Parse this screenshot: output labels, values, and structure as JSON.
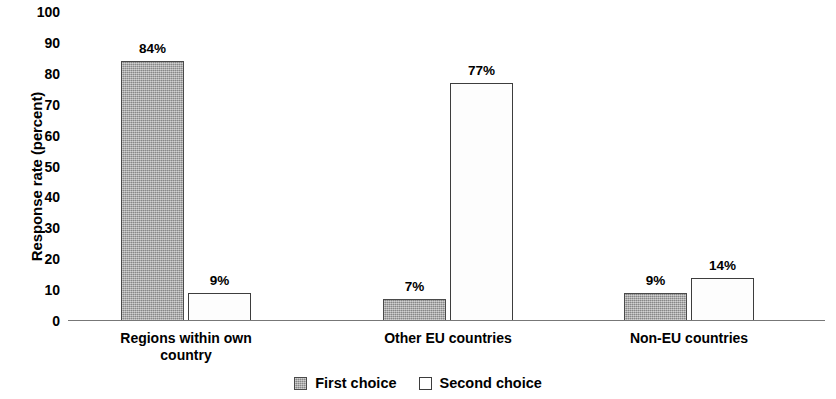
{
  "chart_data": {
    "type": "bar",
    "title": "",
    "xlabel": "",
    "ylabel": "Response rate (percent)",
    "ylim": [
      0,
      100
    ],
    "ytick_step": 10,
    "yticks": [
      "100",
      "90",
      "80",
      "70",
      "60",
      "50",
      "40",
      "30",
      "20",
      "10",
      "0"
    ],
    "grid": false,
    "legend_position": "bottom-center",
    "categories": [
      "Regions within own country",
      "Other EU countries",
      "Non-EU countries"
    ],
    "category_label_lines": [
      [
        "Regions within own",
        "country"
      ],
      [
        "Other EU countries"
      ],
      [
        "Non-EU countries"
      ]
    ],
    "series": [
      {
        "name": "First choice",
        "values": [
          84,
          7,
          9
        ],
        "value_labels": [
          "84%",
          "7%",
          "9%"
        ],
        "color": "#ababab",
        "border_color": "#4a4a4a",
        "fill": "gray-dither"
      },
      {
        "name": "Second choice",
        "values": [
          9,
          77,
          14
        ],
        "value_labels": [
          "9%",
          "77%",
          "14%"
        ],
        "color": "#ffffff",
        "border_color": "#3d3d3d",
        "fill": "white"
      }
    ]
  },
  "legend": {
    "items": [
      {
        "label": "First choice",
        "swatch": "first"
      },
      {
        "label": "Second choice",
        "swatch": "second"
      }
    ]
  },
  "geometry": {
    "plot_left": 68,
    "plot_top": 12,
    "plot_width": 757,
    "plot_height": 309,
    "baseline_y": 321,
    "bar_width": 63,
    "group_centers": [
      186,
      448,
      689
    ],
    "bar_gap": 4
  }
}
